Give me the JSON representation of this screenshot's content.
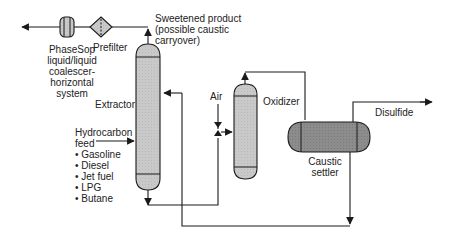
{
  "diagram": {
    "colors": {
      "line": "#1a1a1a",
      "vessel_fill": "#c8c8c8",
      "vessel_dark_fill": "#8a8a8a",
      "text": "#222222"
    },
    "equipment": {
      "coalescer": {
        "label_lines": [
          "PhaseSop",
          "liquid/liquid",
          "coalescer-",
          "horizontal",
          "system"
        ]
      },
      "prefilter": {
        "label": "Prefilter"
      },
      "extractor": {
        "label": "Extractor"
      },
      "oxidizer": {
        "label": "Oxidizer"
      },
      "caustic_settler": {
        "label_lines": [
          "Caustic",
          "settler"
        ]
      }
    },
    "streams": {
      "sweetened_product": {
        "label_lines": [
          "Sweetened product",
          "(possible caustic",
          "carryover)"
        ]
      },
      "air": {
        "label": "Air"
      },
      "disulfide": {
        "label": "Disulfide"
      },
      "hydrocarbon_feed": {
        "label_lines": [
          "Hydrocarbon",
          "feed"
        ],
        "items": [
          "• Gasoline",
          "• Diesel",
          "• Jet fuel",
          "• LPG",
          "• Butane"
        ]
      }
    }
  }
}
